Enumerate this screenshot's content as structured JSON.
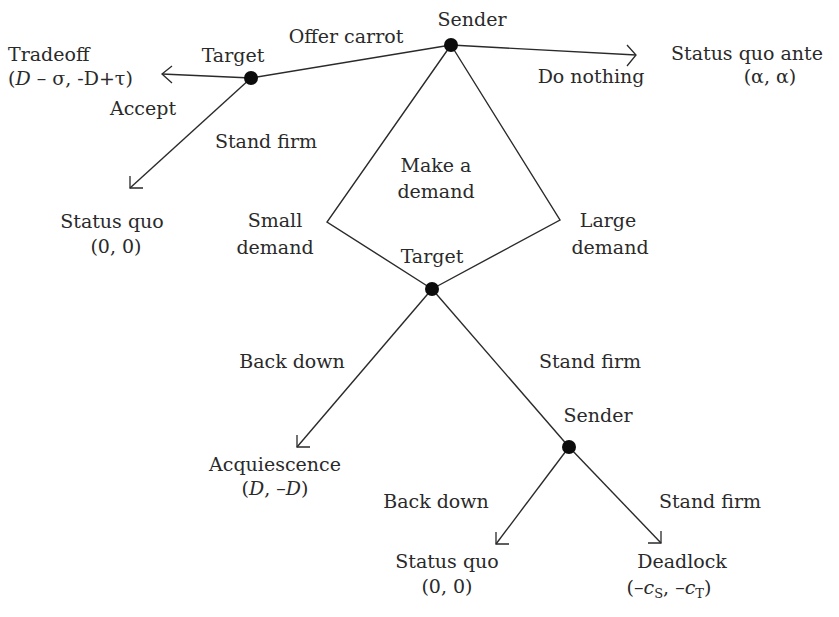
{
  "nodes": {
    "root": {
      "player": "Sender"
    },
    "carrot_target": {
      "player": "Target"
    },
    "demand_target": {
      "player": "Target"
    },
    "final_sender": {
      "player": "Sender"
    }
  },
  "actions": {
    "offer_carrot": "Offer carrot",
    "do_nothing": "Do nothing",
    "make_demand_line1": "Make a",
    "make_demand_line2": "demand",
    "small_demand_line1": "Small",
    "small_demand_line2": "demand",
    "large_demand_line1": "Large",
    "large_demand_line2": "demand",
    "carrot_accept": "Accept",
    "carrot_stand_firm": "Stand firm",
    "target_back_down": "Back down",
    "target_stand_firm": "Stand firm",
    "sender_back_down": "Back down",
    "sender_stand_firm": "Stand firm"
  },
  "outcomes": {
    "tradeoff": {
      "name": "Tradeoff",
      "payoff_D1": "D",
      "payoff_rest": " – σ, -D+τ",
      "open": "(",
      "close": ")"
    },
    "status_quo_ante": {
      "name": "Status quo ante",
      "payoff": "(α, α)"
    },
    "status_quo_carrot": {
      "name": "Status quo",
      "payoff": "(0, 0)"
    },
    "acquiescence": {
      "name": "Acquiescence",
      "open": "(",
      "v1": "D",
      "sep": ", –",
      "v2": "D",
      "close": ")"
    },
    "status_quo_final": {
      "name": "Status quo",
      "payoff": "(0, 0)"
    },
    "deadlock": {
      "name": "Deadlock",
      "open": "(–",
      "c1": "c",
      "s1": "S",
      "sep": ", –",
      "c2": "c",
      "s2": "T",
      "close": ")"
    }
  }
}
